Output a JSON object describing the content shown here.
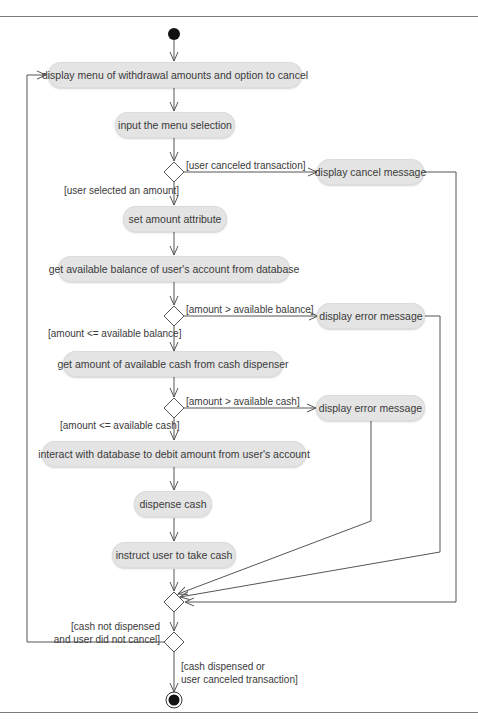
{
  "diagram": {
    "type": "UML activity diagram",
    "initial_node": "start",
    "final_node": "end",
    "actions": [
      {
        "id": "a1",
        "label": "display menu of withdrawal amounts and option to cancel"
      },
      {
        "id": "a2",
        "label": "input the menu selection"
      },
      {
        "id": "a3",
        "label": "display cancel message"
      },
      {
        "id": "a4",
        "label": "set amount attribute"
      },
      {
        "id": "a5",
        "label": "get available balance of user's account from database"
      },
      {
        "id": "a6",
        "label": "display error message"
      },
      {
        "id": "a7",
        "label": "get amount of available cash from cash dispenser"
      },
      {
        "id": "a8",
        "label": "display error message"
      },
      {
        "id": "a9",
        "label": "interact with database to debit amount from user's account"
      },
      {
        "id": "a10",
        "label": "dispense cash"
      },
      {
        "id": "a11",
        "label": "instruct user to take cash"
      }
    ],
    "guards": {
      "user_canceled": "[user canceled transaction]",
      "user_selected": "[user selected an amount]",
      "amount_gt_balance": "[amount > available balance]",
      "amount_le_balance": "[amount <= available balance]",
      "amount_gt_cash": "[amount > available cash]",
      "amount_le_cash": "[amount <= available cash]",
      "loop_back_line1": "[cash not dispensed",
      "loop_back_line2": "and user did not cancel]",
      "exit_line1": "[cash dispensed or",
      "exit_line2": "user canceled transaction]"
    },
    "decisions": [
      {
        "id": "d1",
        "branches": [
          "user_canceled -> a3",
          "user_selected -> a4"
        ]
      },
      {
        "id": "d2",
        "branches": [
          "amount_gt_balance -> a6",
          "amount_le_balance -> a7"
        ]
      },
      {
        "id": "d3",
        "branches": [
          "amount_gt_cash -> a8",
          "amount_le_cash -> a9"
        ]
      },
      {
        "id": "m1",
        "kind": "merge",
        "inputs": [
          "a11",
          "a8",
          "a6",
          "a3"
        ]
      },
      {
        "id": "d4",
        "branches": [
          "loop_back -> a1",
          "exit -> end"
        ]
      }
    ],
    "colors": {
      "node_fill": "#e4e4e4",
      "line": "#555555",
      "text": "#3a3a3a"
    }
  }
}
